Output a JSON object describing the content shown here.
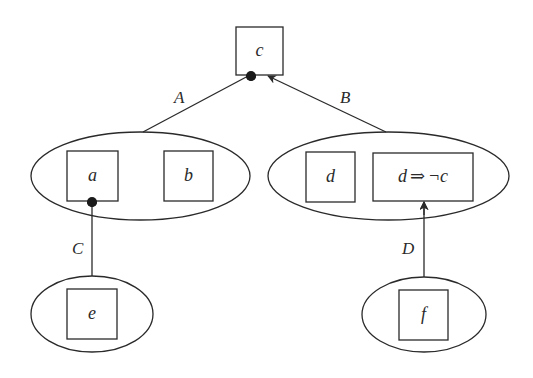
{
  "diagram": {
    "type": "argumentation-graph",
    "nodes": {
      "c": {
        "label": "c"
      },
      "a": {
        "label": "a"
      },
      "b": {
        "label": "b"
      },
      "d": {
        "label": "d"
      },
      "d_implies_not_c": {
        "label_left": "d",
        "label_op": "⇒",
        "label_right": "¬c"
      },
      "e": {
        "label": "e"
      },
      "f": {
        "label": "f"
      }
    },
    "groups": [
      {
        "id": "left-group",
        "members": [
          "a",
          "b"
        ]
      },
      {
        "id": "right-group",
        "members": [
          "d",
          "d_implies_not_c"
        ]
      },
      {
        "id": "bottom-left-group",
        "members": [
          "e"
        ]
      },
      {
        "id": "bottom-right-group",
        "members": [
          "f"
        ]
      }
    ],
    "edges": [
      {
        "label": "A",
        "from": "left-group",
        "to": "c",
        "head": "dot"
      },
      {
        "label": "B",
        "from": "right-group",
        "to": "c",
        "head": "arrow"
      },
      {
        "label": "C",
        "from": "bottom-left-group",
        "to": "a",
        "head": "dot"
      },
      {
        "label": "D",
        "from": "bottom-right-group",
        "to": "d_implies_not_c",
        "head": "arrow"
      }
    ]
  }
}
